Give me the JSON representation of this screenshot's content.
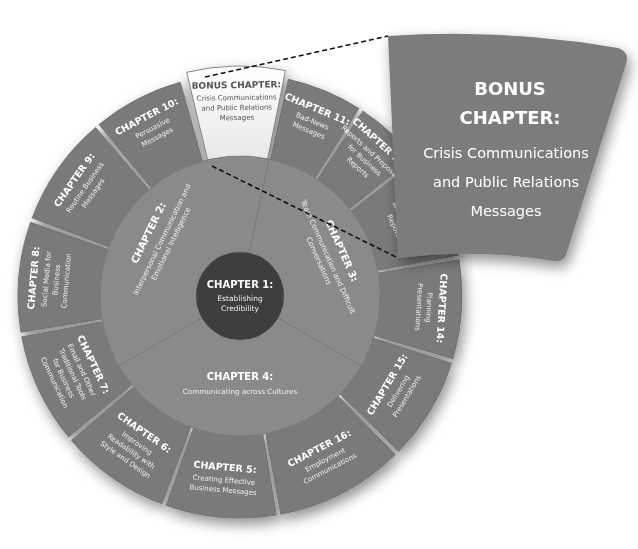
{
  "wheel": {
    "center": {
      "x": 240,
      "y": 296
    },
    "radii": {
      "inner": 44,
      "middle": 140,
      "outer": 222
    },
    "colors": {
      "outer_segment": "#7a7a7a",
      "middle_segment": "#8a8a8a",
      "inner_circle": "#3e3e3e",
      "bonus_segment": "#f4f4f4",
      "bonus_text": "#555555",
      "callout": "#7c7c7c",
      "text": "#ffffff"
    },
    "center_chapter": {
      "title": "CHAPTER 1:",
      "lines": [
        "Establishing",
        "Credibility"
      ]
    },
    "middle_segments": [
      {
        "title": "CHAPTER 2:",
        "lines": [
          "Interpersonal Communication and",
          "Emotional Intelligence"
        ]
      },
      {
        "title": "CHAPTER 3:",
        "lines": [
          "Team Communication and Difficult",
          "Conversations"
        ]
      },
      {
        "title": "CHAPTER 4:",
        "lines": [
          "Communicating across Cultures"
        ]
      }
    ],
    "outer_segments": [
      {
        "title": "CHAPTER 10:",
        "lines": [
          "Persuasive",
          "Messages"
        ]
      },
      {
        "title": "BONUS CHAPTER:",
        "lines": [
          "Crisis Communications",
          "and Public Relations",
          "Messages"
        ],
        "highlighted": true
      },
      {
        "title": "CHAPTER 11:",
        "lines": [
          "Bad-News",
          "Messages"
        ]
      },
      {
        "title": "CHAPTER 12:",
        "lines": [
          "Reports and Proposals",
          "for Business",
          "Reports"
        ]
      },
      {
        "title": "CHAPTER 13:",
        "lines": [
          "Completing",
          "Business Proposals",
          "and Business",
          "Reports"
        ]
      },
      {
        "title": "CHAPTER 14:",
        "lines": [
          "Planning",
          "Presentations"
        ]
      },
      {
        "title": "CHAPTER 15:",
        "lines": [
          "Delivering",
          "Presentations"
        ]
      },
      {
        "title": "CHAPTER 16:",
        "lines": [
          "Employment",
          "Communications"
        ]
      },
      {
        "title": "CHAPTER 5:",
        "lines": [
          "Creating Effective",
          "Business Messages"
        ]
      },
      {
        "title": "CHAPTER 6:",
        "lines": [
          "Improving",
          "Readability with",
          "Style and Design"
        ]
      },
      {
        "title": "CHAPTER 7:",
        "lines": [
          "Email and Other",
          "Traditional Tools",
          "for Business",
          "Communication"
        ]
      },
      {
        "title": "CHAPTER 8:",
        "lines": [
          "Social Media for",
          "Business",
          "Communication"
        ]
      },
      {
        "title": "CHAPTER 9:",
        "lines": [
          "Routine Business",
          "Messages"
        ]
      }
    ]
  },
  "callout": {
    "title_line1": "BONUS",
    "title_line2": "CHAPTER:",
    "lines": [
      "Crisis Communications",
      "and Public Relations",
      "Messages"
    ]
  }
}
